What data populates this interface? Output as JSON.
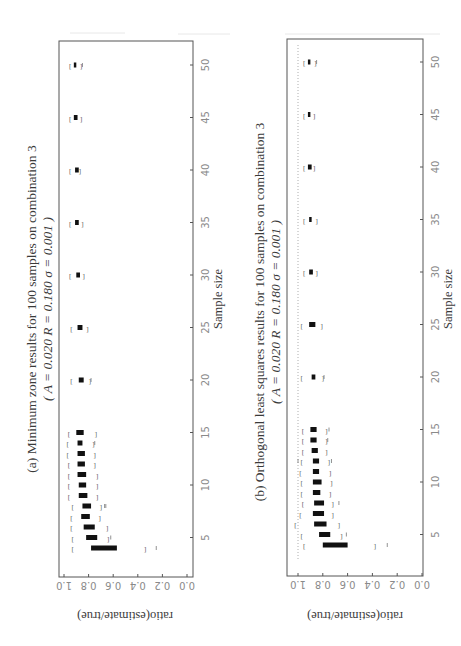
{
  "page": {
    "orientation": "rotated-90-ccw",
    "top_rule_color": "#e6e6e6"
  },
  "chart_data": [
    {
      "type": "boxplot",
      "panel": "a",
      "title": "(a) Minimum zone results for 100 samples on combination 3",
      "subtitle": "( A = 0.020      R = 0.180      σ = 0.001 )",
      "xlabel": "Sample size",
      "ylabel": "ratio(estimate/true)",
      "x_ticks": [
        5,
        10,
        15,
        20,
        25,
        30,
        35,
        40,
        45,
        50
      ],
      "y_ticks": [
        "0.0",
        "0.2",
        "0.4",
        "0.6",
        "0.8",
        "1.0"
      ],
      "ylim": [
        0.0,
        1.0
      ],
      "xlim": [
        3,
        52
      ],
      "reference_line": null,
      "categories": [
        4,
        5,
        6,
        7,
        8,
        9,
        10,
        11,
        12,
        13,
        14,
        15,
        20,
        25,
        30,
        35,
        40,
        45,
        50
      ],
      "boxes": [
        {
          "n": 4,
          "whisker_lo": 0.34,
          "q1": 0.57,
          "q3": 0.78,
          "whisker_hi": 0.93,
          "outliers": [
            0.25
          ]
        },
        {
          "n": 5,
          "whisker_lo": 0.64,
          "q1": 0.73,
          "q3": 0.82,
          "whisker_hi": 0.93,
          "outliers": [
            0.62
          ]
        },
        {
          "n": 6,
          "whisker_lo": 0.65,
          "q1": 0.75,
          "q3": 0.84,
          "whisker_hi": 0.94,
          "outliers": []
        },
        {
          "n": 7,
          "whisker_lo": 0.71,
          "q1": 0.79,
          "q3": 0.86,
          "whisker_hi": 0.94,
          "outliers": []
        },
        {
          "n": 8,
          "whisker_lo": 0.7,
          "q1": 0.78,
          "q3": 0.85,
          "whisker_hi": 0.93,
          "outliers": [
            0.67,
            0.66
          ]
        },
        {
          "n": 9,
          "whisker_lo": 0.73,
          "q1": 0.81,
          "q3": 0.88,
          "whisker_hi": 0.96,
          "outliers": []
        },
        {
          "n": 10,
          "whisker_lo": 0.73,
          "q1": 0.82,
          "q3": 0.88,
          "whisker_hi": 0.96,
          "outliers": []
        },
        {
          "n": 11,
          "whisker_lo": 0.73,
          "q1": 0.82,
          "q3": 0.89,
          "whisker_hi": 0.96,
          "outliers": []
        },
        {
          "n": 12,
          "whisker_lo": 0.75,
          "q1": 0.83,
          "q3": 0.89,
          "whisker_hi": 0.96,
          "outliers": []
        },
        {
          "n": 13,
          "whisker_lo": 0.75,
          "q1": 0.83,
          "q3": 0.89,
          "whisker_hi": 0.97,
          "outliers": []
        },
        {
          "n": 14,
          "whisker_lo": 0.76,
          "q1": 0.85,
          "q3": 0.89,
          "whisker_hi": 0.97,
          "outliers": [
            0.75
          ]
        },
        {
          "n": 15,
          "whisker_lo": 0.74,
          "q1": 0.84,
          "q3": 0.9,
          "whisker_hi": 0.96,
          "outliers": []
        },
        {
          "n": 20,
          "whisker_lo": 0.79,
          "q1": 0.84,
          "q3": 0.88,
          "whisker_hi": 0.94,
          "outliers": [
            0.78
          ]
        },
        {
          "n": 25,
          "whisker_lo": 0.81,
          "q1": 0.85,
          "q3": 0.89,
          "whisker_hi": 0.94,
          "outliers": []
        },
        {
          "n": 30,
          "whisker_lo": 0.84,
          "q1": 0.87,
          "q3": 0.9,
          "whisker_hi": 0.95,
          "outliers": []
        },
        {
          "n": 35,
          "whisker_lo": 0.85,
          "q1": 0.88,
          "q3": 0.91,
          "whisker_hi": 0.95,
          "outliers": []
        },
        {
          "n": 40,
          "whisker_lo": 0.87,
          "q1": 0.88,
          "q3": 0.91,
          "whisker_hi": 0.95,
          "outliers": []
        },
        {
          "n": 45,
          "whisker_lo": 0.86,
          "q1": 0.89,
          "q3": 0.92,
          "whisker_hi": 0.95,
          "outliers": []
        },
        {
          "n": 50,
          "whisker_lo": 0.86,
          "q1": 0.9,
          "q3": 0.92,
          "whisker_hi": 0.95,
          "outliers": [
            0.85
          ]
        }
      ]
    },
    {
      "type": "boxplot",
      "panel": "b",
      "title": "(b) Orthogonal least squares results for 100 samples on combination 3",
      "subtitle": "( A = 0.020      R = 0.180      σ = 0.001 )",
      "xlabel": "Sample size",
      "ylabel": "ratio(estimate/true)",
      "x_ticks": [
        5,
        10,
        15,
        20,
        25,
        30,
        35,
        40,
        45,
        50
      ],
      "y_ticks": [
        "0.0",
        "0.2",
        "0.4",
        "0.6",
        "0.8",
        "1.0"
      ],
      "ylim": [
        0.0,
        1.0
      ],
      "xlim": [
        3,
        52
      ],
      "reference_line": 1.0,
      "categories": [
        4,
        5,
        6,
        7,
        8,
        9,
        10,
        11,
        12,
        13,
        14,
        15,
        20,
        25,
        30,
        35,
        40,
        45,
        50
      ],
      "boxes": [
        {
          "n": 4,
          "whisker_lo": 0.38,
          "q1": 0.6,
          "q3": 0.8,
          "whisker_hi": 0.95,
          "outliers": [
            0.28
          ]
        },
        {
          "n": 5,
          "whisker_lo": 0.65,
          "q1": 0.74,
          "q3": 0.83,
          "whisker_hi": 0.97,
          "outliers": [
            0.61
          ]
        },
        {
          "n": 6,
          "whisker_lo": 0.67,
          "q1": 0.77,
          "q3": 0.87,
          "whisker_hi": 1.02,
          "outliers": []
        },
        {
          "n": 7,
          "whisker_lo": 0.72,
          "q1": 0.79,
          "q3": 0.88,
          "whisker_hi": 0.98,
          "outliers": []
        },
        {
          "n": 8,
          "whisker_lo": 0.72,
          "q1": 0.79,
          "q3": 0.87,
          "whisker_hi": 0.96,
          "outliers": [
            0.67
          ]
        },
        {
          "n": 9,
          "whisker_lo": 0.74,
          "q1": 0.82,
          "q3": 0.88,
          "whisker_hi": 0.97,
          "outliers": []
        },
        {
          "n": 10,
          "whisker_lo": 0.73,
          "q1": 0.81,
          "q3": 0.88,
          "whisker_hi": 0.97,
          "outliers": []
        },
        {
          "n": 11,
          "whisker_lo": 0.74,
          "q1": 0.83,
          "q3": 0.88,
          "whisker_hi": 0.98,
          "outliers": []
        },
        {
          "n": 12,
          "whisker_lo": 0.75,
          "q1": 0.83,
          "q3": 0.88,
          "whisker_hi": 0.97,
          "outliers": [
            0.73,
            1.0
          ]
        },
        {
          "n": 13,
          "whisker_lo": 0.77,
          "q1": 0.84,
          "q3": 0.89,
          "whisker_hi": 0.96,
          "outliers": []
        },
        {
          "n": 14,
          "whisker_lo": 0.77,
          "q1": 0.85,
          "q3": 0.9,
          "whisker_hi": 0.96,
          "outliers": [
            0.76
          ]
        },
        {
          "n": 15,
          "whisker_lo": 0.77,
          "q1": 0.85,
          "q3": 0.9,
          "whisker_hi": 0.96,
          "outliers": [
            0.75
          ]
        },
        {
          "n": 20,
          "whisker_lo": 0.8,
          "q1": 0.86,
          "q3": 0.89,
          "whisker_hi": 0.97,
          "outliers": [
            0.79
          ]
        },
        {
          "n": 25,
          "whisker_lo": 0.81,
          "q1": 0.86,
          "q3": 0.91,
          "whisker_hi": 0.97,
          "outliers": []
        },
        {
          "n": 30,
          "whisker_lo": 0.85,
          "q1": 0.88,
          "q3": 0.91,
          "whisker_hi": 0.95,
          "outliers": []
        },
        {
          "n": 35,
          "whisker_lo": 0.85,
          "q1": 0.89,
          "q3": 0.91,
          "whisker_hi": 0.95,
          "outliers": []
        },
        {
          "n": 40,
          "whisker_lo": 0.87,
          "q1": 0.89,
          "q3": 0.92,
          "whisker_hi": 0.95,
          "outliers": []
        },
        {
          "n": 45,
          "whisker_lo": 0.87,
          "q1": 0.9,
          "q3": 0.92,
          "whisker_hi": 0.95,
          "outliers": []
        },
        {
          "n": 50,
          "whisker_lo": 0.86,
          "q1": 0.9,
          "q3": 0.92,
          "whisker_hi": 0.95,
          "outliers": [
            0.85
          ]
        }
      ]
    }
  ],
  "labels": {
    "a_title": "(a) Minimum zone results for 100 samples on combination 3",
    "a_subtitle": "( A = 0.020      R = 0.180      σ = 0.001 )",
    "b_title": "(b) Orthogonal least squares results for 100 samples on combination 3",
    "b_subtitle": "( A = 0.020      R = 0.180      σ = 0.001 )",
    "xlabel": "Sample size",
    "ylabel": "ratio(estimate/true)"
  },
  "colors": {
    "box": "#111111",
    "frame": "#555555",
    "tick_label": "#8a8a8a",
    "text": "#3a3a3a",
    "reference_line": "#999999"
  }
}
